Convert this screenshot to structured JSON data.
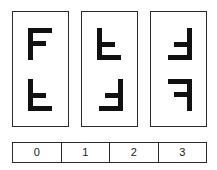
{
  "figure": {
    "background_color": "#ffffff",
    "stroke_color": "#2b2b2b",
    "glyph_color": "#111111",
    "glyph_letter": "F",
    "panels": [
      {
        "name": "panel-0",
        "glyphs": [
          {
            "letter": "F",
            "orientation": "upright",
            "rotation_deg": 0,
            "mirrored": false
          },
          {
            "letter": "F",
            "orientation": "flipped-vertical",
            "rotation_deg": 0,
            "mirrored": true
          }
        ]
      },
      {
        "name": "panel-1",
        "glyphs": [
          {
            "letter": "F",
            "orientation": "flipped-vertical",
            "rotation_deg": 0,
            "mirrored": true
          },
          {
            "letter": "F",
            "orientation": "rotated-180",
            "rotation_deg": 180,
            "mirrored": false
          }
        ]
      },
      {
        "name": "panel-2",
        "glyphs": [
          {
            "letter": "F",
            "orientation": "rotated-180",
            "rotation_deg": 180,
            "mirrored": false
          },
          {
            "letter": "F",
            "orientation": "flipped-horizontal",
            "rotation_deg": 0,
            "mirrored": true
          }
        ]
      }
    ]
  },
  "scale_strip": {
    "name": "number-strip",
    "cells": [
      {
        "label": "0"
      },
      {
        "label": "1"
      },
      {
        "label": "2"
      },
      {
        "label": "3"
      }
    ]
  }
}
